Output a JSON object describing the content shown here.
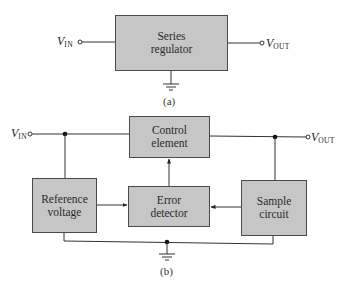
{
  "diagram": {
    "colors": {
      "block_fill": "#c6c6c6",
      "line": "#333333",
      "background": "#ffffff"
    },
    "figure_a": {
      "caption": "(a)",
      "input_label": {
        "symbol": "V",
        "subscript": "IN"
      },
      "output_label": {
        "symbol": "V",
        "subscript": "OUT"
      },
      "block": {
        "line1": "Series",
        "line2": "regulator"
      },
      "ground": "ground-symbol"
    },
    "figure_b": {
      "caption": "(b)",
      "input_label": {
        "symbol": "V",
        "subscript": "IN"
      },
      "output_label": {
        "symbol": "V",
        "subscript": "OUT"
      },
      "blocks": {
        "control": {
          "line1": "Control",
          "line2": "element"
        },
        "reference": {
          "line1": "Reference",
          "line2": "voltage"
        },
        "error": {
          "line1": "Error",
          "line2": "detector"
        },
        "sample": {
          "line1": "Sample",
          "line2": "circuit"
        }
      },
      "connections": [
        {
          "from": "VIN",
          "to": "control"
        },
        {
          "from": "control",
          "to": "VOUT"
        },
        {
          "from": "VIN-node",
          "to": "reference"
        },
        {
          "from": "reference",
          "to": "error",
          "arrow": true
        },
        {
          "from": "sample",
          "to": "error",
          "arrow": true
        },
        {
          "from": "error",
          "to": "control",
          "arrow": true
        },
        {
          "from": "VOUT-node",
          "to": "sample"
        },
        {
          "from": "reference",
          "to": "ground"
        },
        {
          "from": "sample",
          "to": "ground"
        }
      ]
    }
  }
}
